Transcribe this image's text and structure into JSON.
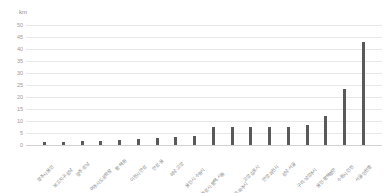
{
  "chart_data": {
    "type": "bar",
    "title": "",
    "subtitle": "",
    "xlabel": "",
    "ylabel": "km",
    "unit_caption": "km",
    "ylim": [
      0,
      50
    ],
    "ytick_step": 5,
    "yticks": [
      "50",
      "45",
      "40",
      "35",
      "30",
      "25",
      "20",
      "15",
      "10",
      "5",
      "0"
    ],
    "ytick_values": [
      50,
      45,
      40,
      35,
      30,
      25,
      20,
      15,
      10,
      5,
      0
    ],
    "grid": true,
    "grid_axis": "y",
    "legend": false,
    "legend_position": "none",
    "bar_color": "#595959",
    "grid_color": "#e8e8e8",
    "background_color": "#ffffff",
    "categories": [
      "광주시·용인",
      "보고지구·성남",
      "광주·성남",
      "여주시도로확장",
      "평·택원",
      "이천시·안성",
      "안성·용",
      "하남·고양",
      "용인시·수원시",
      "화성시·평택·시흥",
      "인천김포고속도로·파주시",
      "고양·김포시",
      "안양·과천시",
      "성남·서울",
      "구리·남양주시",
      "용인·평택항만",
      "수원시·인천",
      "서울·인천항"
    ],
    "values": [
      1.2,
      1.4,
      1.5,
      1.7,
      1.9,
      2.3,
      3.0,
      3.4,
      3.8,
      7.4,
      7.4,
      7.5,
      7.6,
      7.6,
      8.3,
      12.0,
      23.3,
      42.8
    ]
  }
}
